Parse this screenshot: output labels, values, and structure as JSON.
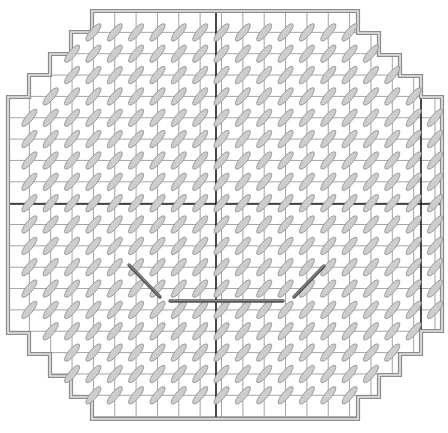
{
  "diagram": {
    "type": "needlepoint-stitch-chart",
    "colors": {
      "background": "#ffffff",
      "grid": "#9a9a9a",
      "center_lines": "#1a1a1a",
      "border": "#8c8c8c",
      "stitch_fill": "#cdcdcd",
      "stitch_stroke": "#8f8f8f",
      "mouth": "#555555"
    },
    "grid": {
      "origin_x": 8,
      "origin_y": 11,
      "cell": 21.35,
      "cols": 20,
      "rows": 19
    },
    "outline_steps": {
      "left": [
        {
          "x": 92,
          "y_from": 11,
          "y_to": 32
        },
        {
          "x": 71,
          "y_from": 32,
          "y_to": 54
        },
        {
          "x": 50,
          "y_from": 54,
          "y_to": 75
        },
        {
          "x": 29,
          "y_from": 75,
          "y_to": 97
        },
        {
          "x": 8,
          "y_from": 97,
          "y_to": 333
        },
        {
          "x": 29,
          "y_from": 333,
          "y_to": 354
        },
        {
          "x": 50,
          "y_from": 354,
          "y_to": 376
        },
        {
          "x": 71,
          "y_from": 376,
          "y_to": 397
        },
        {
          "x": 92,
          "y_from": 397,
          "y_to": 419
        }
      ],
      "right": [
        {
          "x": 358,
          "y_from": 11,
          "y_to": 33
        },
        {
          "x": 379,
          "y_from": 33,
          "y_to": 55
        },
        {
          "x": 400,
          "y_from": 55,
          "y_to": 76
        },
        {
          "x": 421,
          "y_from": 76,
          "y_to": 97
        },
        {
          "x": 442,
          "y_from": 97,
          "y_to": 331
        },
        {
          "x": 421,
          "y_from": 331,
          "y_to": 354
        },
        {
          "x": 400,
          "y_from": 354,
          "y_to": 375
        },
        {
          "x": 379,
          "y_from": 375,
          "y_to": 397
        },
        {
          "x": 358,
          "y_from": 397,
          "y_to": 419
        }
      ]
    },
    "center_lines": {
      "vertical_x": 216,
      "horizontal_y": 204,
      "right_guide_x": 421
    },
    "stitch": {
      "length": 22,
      "width": 7,
      "angle_deg": -50
    },
    "mouth": {
      "left_diagonal": {
        "x1": 129,
        "y1": 265,
        "x2": 160,
        "y2": 297
      },
      "bottom": {
        "x1": 170,
        "y1": 301,
        "x2": 283,
        "y2": 301
      },
      "right_diagonal": {
        "x1": 294,
        "y1": 297,
        "x2": 324,
        "y2": 266
      }
    }
  }
}
